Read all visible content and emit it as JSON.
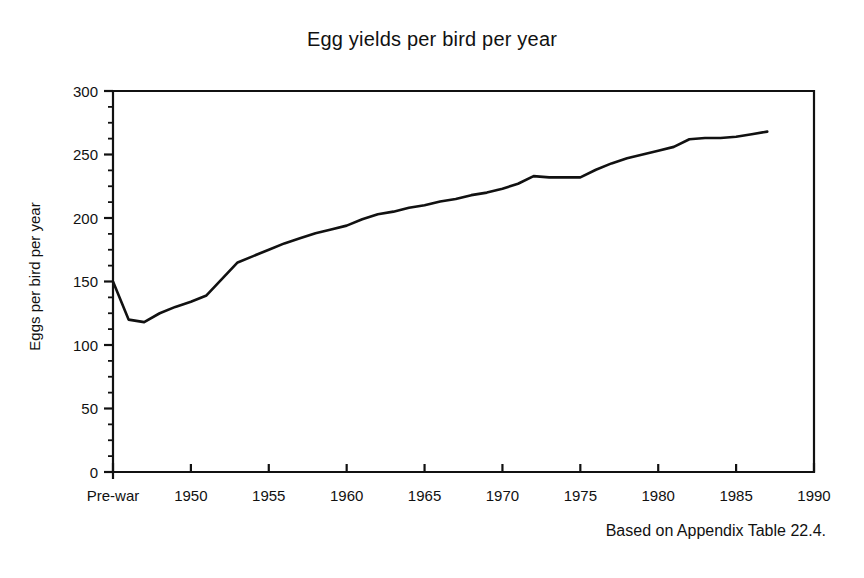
{
  "figure": {
    "title": "Egg yields per bird per year",
    "source_note": "Based on Appendix Table 22.4."
  },
  "chart_data": {
    "type": "line",
    "title": "Egg yields per bird per year",
    "subtitle": "",
    "xlabel": "",
    "ylabel": "Eggs per bird per year",
    "xlim": [
      1945,
      1990
    ],
    "ylim": [
      0,
      300
    ],
    "grid": false,
    "legend": null,
    "y_ticks": [
      0,
      50,
      100,
      150,
      200,
      250,
      300
    ],
    "y_tick_labels": [
      "0",
      "50",
      "100",
      "150",
      "200",
      "250",
      "300"
    ],
    "y_minor_tick_step": 12.5,
    "x_ticks": [
      1945,
      1950,
      1955,
      1960,
      1965,
      1970,
      1975,
      1980,
      1985,
      1990
    ],
    "x_tick_labels": [
      "Pre-war",
      "1950",
      "1955",
      "1960",
      "1965",
      "1970",
      "1975",
      "1980",
      "1985",
      "1990"
    ],
    "annotations": [
      "Based on Appendix Table 22.4."
    ],
    "series": [
      {
        "name": "Eggs per bird per year",
        "x": [
          1945,
          1946,
          1947,
          1948,
          1949,
          1950,
          1951,
          1952,
          1953,
          1954,
          1955,
          1956,
          1957,
          1958,
          1959,
          1960,
          1961,
          1962,
          1963,
          1964,
          1965,
          1966,
          1967,
          1968,
          1969,
          1970,
          1971,
          1972,
          1973,
          1974,
          1975,
          1976,
          1977,
          1978,
          1979,
          1980,
          1981,
          1982,
          1983,
          1984,
          1985,
          1986,
          1987
        ],
        "values": [
          150,
          120,
          118,
          125,
          130,
          134,
          139,
          152,
          165,
          170,
          175,
          180,
          184,
          188,
          191,
          194,
          199,
          203,
          205,
          208,
          210,
          213,
          215,
          218,
          220,
          223,
          227,
          233,
          232,
          232,
          232,
          238,
          243,
          247,
          250,
          253,
          256,
          262,
          263,
          263,
          264,
          266,
          268
        ],
        "x_tick_label_first": "Pre-war"
      }
    ]
  }
}
